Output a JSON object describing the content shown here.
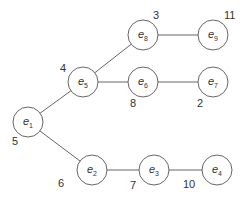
{
  "diagram": {
    "type": "tree",
    "nodes": [
      {
        "id": "e1",
        "base": "e",
        "sub": "1",
        "x": 28,
        "y": 122,
        "weight": "5",
        "wx": 12,
        "wy": 145
      },
      {
        "id": "e2",
        "base": "e",
        "sub": "2",
        "x": 92,
        "y": 170,
        "weight": "6",
        "wx": 58,
        "wy": 187
      },
      {
        "id": "e3",
        "base": "e",
        "sub": "3",
        "x": 154,
        "y": 170,
        "weight": "7",
        "wx": 130,
        "wy": 189
      },
      {
        "id": "e4",
        "base": "e",
        "sub": "4",
        "x": 217,
        "y": 170,
        "weight": "10",
        "wx": 183,
        "wy": 188
      },
      {
        "id": "e5",
        "base": "e",
        "sub": "5",
        "x": 83,
        "y": 82,
        "weight": "4",
        "wx": 60,
        "wy": 72
      },
      {
        "id": "e6",
        "base": "e",
        "sub": "6",
        "x": 143,
        "y": 82,
        "weight": "8",
        "wx": 130,
        "wy": 107
      },
      {
        "id": "e7",
        "base": "e",
        "sub": "7",
        "x": 213,
        "y": 82,
        "weight": "2",
        "wx": 197,
        "wy": 107
      },
      {
        "id": "e8",
        "base": "e",
        "sub": "8",
        "x": 143,
        "y": 35,
        "weight": "3",
        "wx": 153,
        "wy": 19
      },
      {
        "id": "e9",
        "base": "e",
        "sub": "9",
        "x": 213,
        "y": 35,
        "weight": "11",
        "wx": 224,
        "wy": 19
      }
    ],
    "edges": [
      {
        "from": "e1",
        "to": "e5"
      },
      {
        "from": "e1",
        "to": "e2"
      },
      {
        "from": "e5",
        "to": "e8"
      },
      {
        "from": "e5",
        "to": "e6"
      },
      {
        "from": "e8",
        "to": "e9"
      },
      {
        "from": "e6",
        "to": "e7"
      },
      {
        "from": "e2",
        "to": "e3"
      },
      {
        "from": "e3",
        "to": "e4"
      }
    ],
    "node_radius": 15,
    "stroke_color": "#555555",
    "text_color": "#333333"
  }
}
